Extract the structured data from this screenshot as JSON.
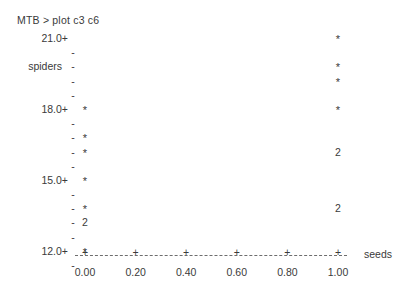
{
  "terminal": {
    "prompt": "MTB > plot c3 c6"
  },
  "chart_data": {
    "type": "scatter",
    "title": "",
    "xlabel": "seeds",
    "ylabel": "spiders",
    "xlim": [
      0.0,
      1.0
    ],
    "ylim": [
      11.5,
      21.0
    ],
    "grid": false,
    "legend": null,
    "style": "minitab-character-plot",
    "x_ticks": [
      {
        "value": 0.0,
        "label": "0.00",
        "pos": 0.0
      },
      {
        "value": 0.2,
        "label": "0.20",
        "pos": 0.2
      },
      {
        "value": 0.4,
        "label": "0.40",
        "pos": 0.4
      },
      {
        "value": 0.6,
        "label": "0.60",
        "pos": 0.6
      },
      {
        "value": 0.8,
        "label": "0.80",
        "pos": 0.8
      },
      {
        "value": 1.0,
        "label": "1.00",
        "pos": 1.0
      }
    ],
    "x_tick_mark": "+",
    "y_tick_mark_major": "+",
    "y_tick_mark_minor": "-",
    "rows": [
      {
        "value": 21.0,
        "label": "21.0+",
        "major": true,
        "mark": "+",
        "axis_name": "",
        "points": [
          {
            "x": 1.0,
            "symbol": "*",
            "count": 1
          }
        ]
      },
      {
        "value": 20.5,
        "label": "",
        "major": false,
        "mark": "-",
        "axis_name": "",
        "points": []
      },
      {
        "value": 20.0,
        "label": "",
        "major": false,
        "mark": "-",
        "axis_name": "spiders",
        "points": [
          {
            "x": 1.0,
            "symbol": "*",
            "count": 1
          }
        ]
      },
      {
        "value": 19.5,
        "label": "",
        "major": false,
        "mark": "-",
        "axis_name": "",
        "points": [
          {
            "x": 1.0,
            "symbol": "*",
            "count": 1
          }
        ]
      },
      {
        "value": 19.0,
        "label": "",
        "major": false,
        "mark": "-",
        "axis_name": "",
        "points": []
      },
      {
        "value": 18.0,
        "label": "18.0+",
        "major": true,
        "mark": "+",
        "axis_name": "",
        "points": [
          {
            "x": 0.0,
            "symbol": "*",
            "count": 1
          },
          {
            "x": 1.0,
            "symbol": "*",
            "count": 1
          }
        ]
      },
      {
        "value": 17.5,
        "label": "",
        "major": false,
        "mark": "-",
        "axis_name": "",
        "points": []
      },
      {
        "value": 17.0,
        "label": "",
        "major": false,
        "mark": "-",
        "axis_name": "",
        "points": [
          {
            "x": 0.0,
            "symbol": "*",
            "count": 1
          }
        ]
      },
      {
        "value": 16.5,
        "label": "",
        "major": false,
        "mark": "-",
        "axis_name": "",
        "points": [
          {
            "x": 0.0,
            "symbol": "*",
            "count": 1
          },
          {
            "x": 1.0,
            "symbol": "2",
            "count": 2
          }
        ]
      },
      {
        "value": 16.0,
        "label": "",
        "major": false,
        "mark": "-",
        "axis_name": "",
        "points": []
      },
      {
        "value": 15.0,
        "label": "15.0+",
        "major": true,
        "mark": "+",
        "axis_name": "",
        "points": [
          {
            "x": 0.0,
            "symbol": "*",
            "count": 1
          }
        ]
      },
      {
        "value": 14.5,
        "label": "",
        "major": false,
        "mark": "-",
        "axis_name": "",
        "points": []
      },
      {
        "value": 14.0,
        "label": "",
        "major": false,
        "mark": "-",
        "axis_name": "",
        "points": [
          {
            "x": 0.0,
            "symbol": "*",
            "count": 1
          },
          {
            "x": 1.0,
            "symbol": "2",
            "count": 2
          }
        ]
      },
      {
        "value": 13.5,
        "label": "",
        "major": false,
        "mark": "-",
        "axis_name": "",
        "points": [
          {
            "x": 0.0,
            "symbol": "2",
            "count": 2
          }
        ]
      },
      {
        "value": 13.0,
        "label": "",
        "major": false,
        "mark": "-",
        "axis_name": "",
        "points": []
      },
      {
        "value": 12.0,
        "label": "12.0+",
        "major": true,
        "mark": "+",
        "axis_name": "",
        "points": [
          {
            "x": 0.0,
            "symbol": "*",
            "count": 1
          }
        ]
      },
      {
        "value": 11.5,
        "label": "",
        "major": false,
        "mark": "-",
        "axis_name": "",
        "points": []
      }
    ]
  },
  "colors": {
    "text": "#3a3a3a",
    "axis": "#6d6d6d",
    "background": "#ffffff"
  }
}
